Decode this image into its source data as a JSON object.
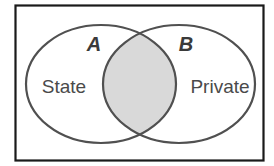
{
  "diagram": {
    "type": "venn",
    "sets": [
      {
        "letter": "A",
        "label": "State"
      },
      {
        "letter": "B",
        "label": "Private"
      }
    ],
    "intersection": {
      "shaded": true
    }
  },
  "colors": {
    "background": "#ffffff",
    "frame": "#1a1a1a",
    "outline": "#505050",
    "intersection_fill": "#d9d9d9",
    "text": "#404040"
  }
}
